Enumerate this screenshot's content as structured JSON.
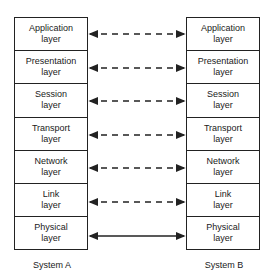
{
  "diagram": {
    "title": "",
    "systems": [
      {
        "name": "System A",
        "layers": [
          {
            "line1": "Application",
            "line2": "layer"
          },
          {
            "line1": "Presentation",
            "line2": "layer"
          },
          {
            "line1": "Session",
            "line2": "layer"
          },
          {
            "line1": "Transport",
            "line2": "layer"
          },
          {
            "line1": "Network",
            "line2": "layer"
          },
          {
            "line1": "Link",
            "line2": "layer"
          },
          {
            "line1": "Physical",
            "line2": "layer"
          }
        ]
      },
      {
        "name": "System B",
        "layers": [
          {
            "line1": "Application",
            "line2": "layer"
          },
          {
            "line1": "Presentation",
            "line2": "layer"
          },
          {
            "line1": "Session",
            "line2": "layer"
          },
          {
            "line1": "Transport",
            "line2": "layer"
          },
          {
            "line1": "Network",
            "line2": "layer"
          },
          {
            "line1": "Link",
            "line2": "layer"
          },
          {
            "line1": "Physical",
            "line2": "layer"
          }
        ]
      }
    ],
    "connections": [
      {
        "layer": "Application",
        "style": "dashed",
        "direction": "bidirectional"
      },
      {
        "layer": "Presentation",
        "style": "dashed",
        "direction": "bidirectional"
      },
      {
        "layer": "Session",
        "style": "dashed",
        "direction": "bidirectional"
      },
      {
        "layer": "Transport",
        "style": "dashed",
        "direction": "bidirectional"
      },
      {
        "layer": "Network",
        "style": "dashed",
        "direction": "bidirectional"
      },
      {
        "layer": "Link",
        "style": "dashed",
        "direction": "bidirectional"
      },
      {
        "layer": "Physical",
        "style": "solid",
        "direction": "bidirectional"
      }
    ],
    "colors": {
      "stroke": "#222222",
      "background": "#ffffff"
    }
  }
}
